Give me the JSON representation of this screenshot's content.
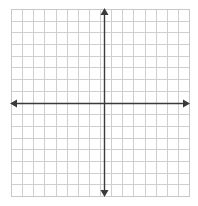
{
  "diagram": {
    "type": "coordinate-plane",
    "grid": {
      "columns": 16,
      "rows": 16,
      "left": 11,
      "top": 9,
      "right": 189,
      "bottom": 196,
      "line_color": "#cfcfcf",
      "border_color": "#c8c8c8"
    },
    "axes": {
      "x_axis_y": 103,
      "y_axis_x": 104,
      "color": "#3a3a3a",
      "x_axis": {
        "from": 10,
        "to": 190,
        "arrows": [
          "left",
          "right"
        ]
      },
      "y_axis": {
        "from": 8,
        "to": 197,
        "arrows": [
          "up",
          "down"
        ]
      }
    },
    "labels": []
  }
}
